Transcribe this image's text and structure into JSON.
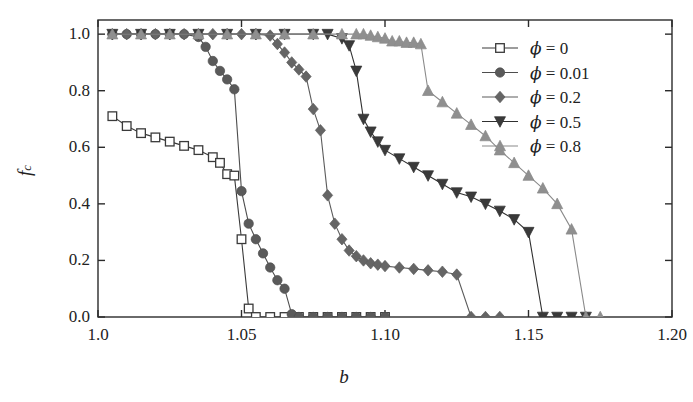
{
  "chart_data": {
    "type": "line",
    "title": "",
    "xlabel": "b",
    "ylabel": "f_c",
    "xlim": [
      1.0,
      1.2
    ],
    "ylim": [
      0.0,
      1.05
    ],
    "xticks": [
      1.0,
      1.05,
      1.1,
      1.15,
      1.2
    ],
    "xtick_labels": [
      "1.0",
      "1.05",
      "1.10",
      "1.15",
      "1.20"
    ],
    "yticks": [
      0.0,
      0.2,
      0.4,
      0.6,
      0.8,
      1.0
    ],
    "ytick_labels": [
      "0.0",
      "0.2",
      "0.4",
      "0.6",
      "0.8",
      "1.0"
    ],
    "grid": false,
    "legend_position": "top-right",
    "series": [
      {
        "name": "phi = 0",
        "label": "ϕ = 0",
        "marker": "open-square",
        "color": "#3a3a3a",
        "fill": "#ffffff",
        "x": [
          1.005,
          1.01,
          1.015,
          1.02,
          1.025,
          1.03,
          1.035,
          1.04,
          1.0425,
          1.045,
          1.0475,
          1.05,
          1.0525,
          1.055,
          1.06,
          1.065,
          1.07,
          1.075,
          1.08,
          1.085,
          1.09,
          1.095,
          1.1
        ],
        "y": [
          0.71,
          0.675,
          0.65,
          0.635,
          0.62,
          0.605,
          0.59,
          0.565,
          0.545,
          0.505,
          0.5,
          0.275,
          0.03,
          0.0,
          0.0,
          0.0,
          0.0,
          0.0,
          0.0,
          0.0,
          0.0,
          0.0,
          0.0
        ]
      },
      {
        "name": "phi = 0.01",
        "label": "ϕ = 0.01",
        "marker": "filled-circle",
        "color": "#4d4d4d",
        "fill": "#5a5a5a",
        "x": [
          1.005,
          1.01,
          1.015,
          1.02,
          1.025,
          1.03,
          1.035,
          1.0375,
          1.04,
          1.0425,
          1.045,
          1.0475,
          1.05,
          1.0525,
          1.055,
          1.0575,
          1.06,
          1.0625,
          1.065,
          1.0675,
          1.07,
          1.075,
          1.08,
          1.085,
          1.09,
          1.095,
          1.1
        ],
        "y": [
          1.0,
          1.0,
          1.0,
          1.0,
          1.0,
          1.0,
          0.99,
          0.955,
          0.905,
          0.87,
          0.84,
          0.805,
          0.445,
          0.33,
          0.275,
          0.225,
          0.175,
          0.13,
          0.1,
          0.01,
          0.0,
          0.0,
          0.0,
          0.0,
          0.0,
          0.0,
          0.0
        ]
      },
      {
        "name": "phi = 0.2",
        "label": "ϕ = 0.2",
        "marker": "filled-diamond",
        "color": "#5c5c5c",
        "fill": "#656565",
        "x": [
          1.005,
          1.01,
          1.015,
          1.02,
          1.025,
          1.03,
          1.035,
          1.04,
          1.045,
          1.05,
          1.055,
          1.06,
          1.0625,
          1.065,
          1.0675,
          1.07,
          1.0725,
          1.075,
          1.0775,
          1.08,
          1.0825,
          1.085,
          1.0875,
          1.09,
          1.0925,
          1.095,
          1.0975,
          1.1,
          1.105,
          1.11,
          1.115,
          1.12,
          1.125,
          1.13,
          1.135,
          1.14
        ],
        "y": [
          1.0,
          1.0,
          1.0,
          1.0,
          1.0,
          1.0,
          1.0,
          1.0,
          1.0,
          1.0,
          1.0,
          0.995,
          0.965,
          0.935,
          0.9,
          0.875,
          0.85,
          0.735,
          0.66,
          0.43,
          0.33,
          0.275,
          0.235,
          0.215,
          0.2,
          0.19,
          0.185,
          0.18,
          0.175,
          0.17,
          0.165,
          0.16,
          0.15,
          0.0,
          0.0,
          0.0
        ]
      },
      {
        "name": "phi = 0.5",
        "label": "ϕ = 0.5",
        "marker": "filled-down-triangle",
        "color": "#303030",
        "fill": "#3a3a3a",
        "x": [
          1.005,
          1.015,
          1.025,
          1.035,
          1.045,
          1.055,
          1.065,
          1.075,
          1.08,
          1.085,
          1.0875,
          1.09,
          1.0925,
          1.095,
          1.0975,
          1.1,
          1.105,
          1.11,
          1.115,
          1.12,
          1.125,
          1.13,
          1.135,
          1.14,
          1.145,
          1.15,
          1.155,
          1.16,
          1.165,
          1.17
        ],
        "y": [
          1.0,
          1.0,
          1.0,
          1.0,
          1.0,
          1.0,
          1.0,
          1.0,
          1.0,
          0.985,
          0.96,
          0.87,
          0.7,
          0.655,
          0.62,
          0.59,
          0.56,
          0.53,
          0.5,
          0.47,
          0.44,
          0.425,
          0.4,
          0.375,
          0.345,
          0.3,
          0.0,
          0.0,
          0.0,
          0.0
        ]
      },
      {
        "name": "phi = 0.8",
        "label": "ϕ = 0.8",
        "marker": "filled-up-triangle",
        "color": "#8a8a8a",
        "fill": "#8f8f8f",
        "x": [
          1.005,
          1.015,
          1.025,
          1.035,
          1.045,
          1.055,
          1.065,
          1.075,
          1.085,
          1.09,
          1.0925,
          1.095,
          1.0975,
          1.1,
          1.1025,
          1.105,
          1.1075,
          1.11,
          1.1125,
          1.115,
          1.12,
          1.125,
          1.13,
          1.135,
          1.14,
          1.145,
          1.15,
          1.155,
          1.16,
          1.165,
          1.17,
          1.175
        ],
        "y": [
          1.0,
          1.0,
          1.0,
          1.0,
          1.0,
          1.0,
          1.0,
          1.0,
          1.0,
          1.0,
          1.0,
          0.995,
          0.99,
          0.985,
          0.975,
          0.975,
          0.97,
          0.97,
          0.965,
          0.8,
          0.76,
          0.72,
          0.68,
          0.64,
          0.59,
          0.545,
          0.5,
          0.455,
          0.4,
          0.31,
          0.0,
          0.0
        ]
      }
    ]
  },
  "axes": {
    "x_title": "b",
    "y_title_main": "f",
    "y_title_sub": "c"
  },
  "legend": {
    "entries": [
      {
        "label": "ϕ = 0",
        "marker": "open-square"
      },
      {
        "label": "ϕ = 0.01",
        "marker": "filled-circle"
      },
      {
        "label": "ϕ = 0.2",
        "marker": "filled-diamond"
      },
      {
        "label": "ϕ = 0.5",
        "marker": "filled-down-triangle"
      },
      {
        "label": "ϕ = 0.8",
        "marker": "filled-up-triangle"
      }
    ]
  }
}
